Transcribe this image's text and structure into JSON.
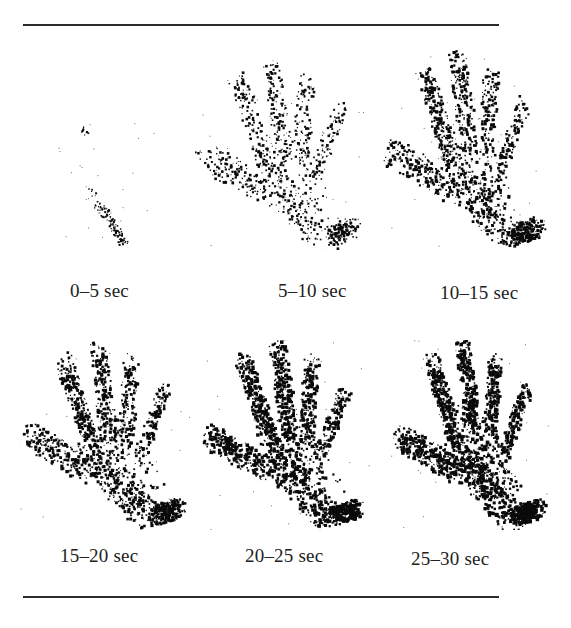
{
  "figure": {
    "panels": [
      {
        "label": "0–5 sec",
        "x": 55,
        "y": 120,
        "w": 100,
        "h": 130,
        "density": 0.08,
        "caption_x": 70,
        "caption_y": 280
      },
      {
        "label": "5–10 sec",
        "x": 195,
        "y": 60,
        "w": 170,
        "h": 190,
        "density": 0.45,
        "caption_x": 278,
        "caption_y": 280
      },
      {
        "label": "10–15 sec",
        "x": 380,
        "y": 50,
        "w": 170,
        "h": 200,
        "density": 0.65,
        "caption_x": 440,
        "caption_y": 282
      },
      {
        "label": "15–20 sec",
        "x": 20,
        "y": 340,
        "w": 170,
        "h": 190,
        "density": 0.7,
        "caption_x": 60,
        "caption_y": 545
      },
      {
        "label": "20–25 sec",
        "x": 200,
        "y": 340,
        "w": 170,
        "h": 190,
        "density": 0.85,
        "caption_x": 245,
        "caption_y": 545
      },
      {
        "label": "25–30 sec",
        "x": 390,
        "y": 340,
        "w": 160,
        "h": 190,
        "density": 0.9,
        "caption_x": 411,
        "caption_y": 548
      }
    ]
  },
  "colors": {
    "ink": "#0a0a0a",
    "background": "#ffffff",
    "rule": "#2a2a2a"
  }
}
